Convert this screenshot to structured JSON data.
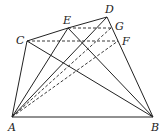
{
  "diagram": {
    "type": "geometry-figure",
    "points": {
      "A": {
        "label": "A",
        "x": 12,
        "y": 117,
        "lx": 8,
        "ly": 131
      },
      "B": {
        "label": "B",
        "x": 153,
        "y": 117,
        "lx": 151,
        "ly": 131
      },
      "C": {
        "label": "C",
        "x": 27,
        "y": 41,
        "lx": 16,
        "ly": 44
      },
      "D": {
        "label": "D",
        "x": 107,
        "y": 17,
        "lx": 105,
        "ly": 13
      },
      "E": {
        "label": "E",
        "x": 68,
        "y": 28,
        "lx": 63,
        "ly": 24
      },
      "F": {
        "label": "F",
        "x": 118,
        "y": 41,
        "lx": 122,
        "ly": 45
      },
      "G": {
        "label": "G",
        "x": 111,
        "y": 28,
        "lx": 115,
        "ly": 30
      }
    },
    "solid_segments": [
      [
        "A",
        "B"
      ],
      [
        "A",
        "C"
      ],
      [
        "C",
        "E"
      ],
      [
        "E",
        "D"
      ],
      [
        "D",
        "B"
      ],
      [
        "C",
        "B"
      ],
      [
        "E",
        "B"
      ],
      [
        "A",
        "E"
      ],
      [
        "A",
        "D"
      ]
    ],
    "dashed_segments": [
      [
        "C",
        "F"
      ],
      [
        "E",
        "G"
      ],
      [
        "A",
        "G"
      ],
      [
        "A",
        "F"
      ]
    ]
  }
}
